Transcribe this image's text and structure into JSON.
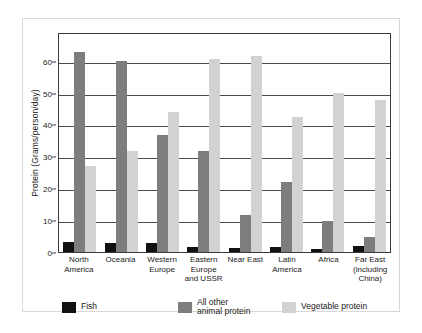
{
  "chart_data": {
    "type": "bar",
    "title": "",
    "xlabel": "",
    "ylabel": "Protein (Grams/person/day)",
    "ylim": [
      0,
      69
    ],
    "yticks": [
      0,
      10,
      20,
      30,
      40,
      50,
      60
    ],
    "grid": true,
    "legend_position": "bottom",
    "categories": [
      "North America",
      "Oceania",
      "Western Europe",
      "Eastern Europe and USSR",
      "Near East",
      "Latin America",
      "Africa",
      "Far East (including China)"
    ],
    "category_label_lines": [
      [
        "North",
        "America"
      ],
      [
        "Oceania"
      ],
      [
        "Western",
        "Europe"
      ],
      [
        "Eastern",
        "Europe",
        "and USSR"
      ],
      [
        "Near East"
      ],
      [
        "Latin",
        "America"
      ],
      [
        "Africa"
      ],
      [
        "Far East",
        "(including",
        "China)"
      ]
    ],
    "series": [
      {
        "name": "Fish",
        "color": "#111111",
        "values": [
          3.0,
          2.8,
          2.8,
          1.7,
          1.2,
          1.5,
          1.0,
          2.0
        ]
      },
      {
        "name": "All other animal protein",
        "color": "#7d7d7d",
        "values": [
          62.8,
          60.0,
          36.8,
          31.6,
          11.5,
          21.9,
          9.8,
          4.8
        ]
      },
      {
        "name": "Vegetable protein",
        "color": "#d2d2d2",
        "values": [
          27.0,
          31.6,
          44.0,
          60.5,
          61.5,
          42.2,
          49.8,
          47.7
        ]
      }
    ],
    "legend": [
      {
        "label": "Fish",
        "lines": [
          "Fish"
        ],
        "color": "#111111"
      },
      {
        "label": "All other animal protein",
        "lines": [
          "All other",
          "animal protein"
        ],
        "color": "#7d7d7d"
      },
      {
        "label": "Vegetable protein",
        "lines": [
          "Vegetable protein"
        ],
        "color": "#d2d2d2"
      }
    ]
  }
}
